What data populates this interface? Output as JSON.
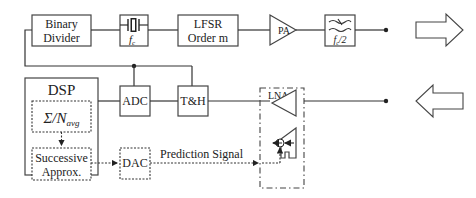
{
  "diagram": {
    "type": "block-diagram",
    "transmit_chain": {
      "binary_divider": {
        "line1": "Binary",
        "line2": "Divider"
      },
      "crystal": {
        "label": "f",
        "subscript": "c"
      },
      "lfsr": {
        "line1": "LFSR",
        "line2": "Order m"
      },
      "pa": {
        "label": "PA"
      },
      "filter": {
        "label": "f",
        "subscript": "c",
        "suffix": "/2"
      }
    },
    "receive_chain": {
      "adc": {
        "label": "ADC"
      },
      "track_hold": {
        "label": "T&H"
      },
      "lna": {
        "label": "LNA"
      }
    },
    "dsp": {
      "title": "DSP",
      "averager": {
        "label": "Σ/N",
        "subscript": "avg"
      },
      "successive_approx": {
        "line1": "Successive",
        "line2": "Approx."
      }
    },
    "dac": {
      "label": "DAC"
    },
    "prediction_signal": {
      "label": "Prediction Signal"
    },
    "arrows": {
      "tx_direction": "right",
      "rx_direction": "left"
    }
  }
}
